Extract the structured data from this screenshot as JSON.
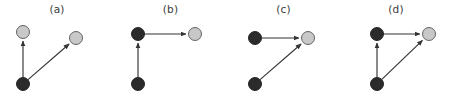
{
  "figure": {
    "width": 452,
    "height": 96,
    "background": "#ffffff",
    "type": "directed-graph-panels",
    "node_colors": {
      "dark": "#2b2b2b",
      "dark_stroke": "#1a1a1a",
      "light": "#c8c8c8",
      "light_stroke": "#555555"
    },
    "edge_color": "#333333",
    "label_color": "#3a3a3a",
    "node_radius": 6.5,
    "panels": [
      {
        "id": "a",
        "label": "(a)",
        "x": 0,
        "width": 114,
        "nodes": [
          {
            "id": "a1",
            "name": "top-left-node",
            "fill": "light",
            "cx": 23,
            "cy": 32
          },
          {
            "id": "a2",
            "name": "top-right-node",
            "fill": "light",
            "cx": 76,
            "cy": 38
          },
          {
            "id": "a3",
            "name": "bottom-left-node",
            "fill": "dark",
            "cx": 23,
            "cy": 84
          }
        ],
        "edges": [
          {
            "from": "a3",
            "to": "a1",
            "name": "edge-bottom-to-topleft"
          },
          {
            "from": "a3",
            "to": "a2",
            "name": "edge-bottom-to-topright"
          }
        ]
      },
      {
        "id": "b",
        "label": "(b)",
        "x": 114,
        "width": 113,
        "nodes": [
          {
            "id": "b1",
            "name": "top-left-node",
            "fill": "dark",
            "cx": 138,
            "cy": 34
          },
          {
            "id": "b2",
            "name": "top-right-node",
            "fill": "light",
            "cx": 195,
            "cy": 34
          },
          {
            "id": "b3",
            "name": "bottom-left-node",
            "fill": "dark",
            "cx": 138,
            "cy": 84
          }
        ],
        "edges": [
          {
            "from": "b3",
            "to": "b1",
            "name": "edge-bottom-to-topleft"
          },
          {
            "from": "b1",
            "to": "b2",
            "name": "edge-topleft-to-topright"
          }
        ]
      },
      {
        "id": "c",
        "label": "(c)",
        "x": 227,
        "width": 113,
        "nodes": [
          {
            "id": "c1",
            "name": "top-left-node",
            "fill": "dark",
            "cx": 255,
            "cy": 38
          },
          {
            "id": "c2",
            "name": "top-right-node",
            "fill": "light",
            "cx": 308,
            "cy": 38
          },
          {
            "id": "c3",
            "name": "bottom-left-node",
            "fill": "dark",
            "cx": 255,
            "cy": 84
          }
        ],
        "edges": [
          {
            "from": "c1",
            "to": "c2",
            "name": "edge-topleft-to-topright"
          },
          {
            "from": "c3",
            "to": "c2",
            "name": "edge-bottom-to-topright"
          }
        ]
      },
      {
        "id": "d",
        "label": "(d)",
        "x": 340,
        "width": 112,
        "nodes": [
          {
            "id": "d1",
            "name": "top-left-node",
            "fill": "dark",
            "cx": 377,
            "cy": 34
          },
          {
            "id": "d2",
            "name": "top-right-node",
            "fill": "light",
            "cx": 429,
            "cy": 34
          },
          {
            "id": "d3",
            "name": "bottom-left-node",
            "fill": "dark",
            "cx": 377,
            "cy": 84
          }
        ],
        "edges": [
          {
            "from": "d3",
            "to": "d1",
            "name": "edge-bottom-to-topleft"
          },
          {
            "from": "d1",
            "to": "d2",
            "name": "edge-topleft-to-topright"
          },
          {
            "from": "d3",
            "to": "d2",
            "name": "edge-bottom-to-topright"
          }
        ]
      }
    ]
  }
}
